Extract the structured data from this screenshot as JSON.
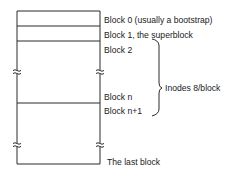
{
  "diagram": {
    "labels": {
      "block0": "Block 0 (usually a bootstrap)",
      "block1": "Block 1, the superblock",
      "block2": "Block 2",
      "inodes": "Inodes 8/block",
      "blockn": "Block n",
      "blockn1": "Block n+1",
      "last": "The last block"
    },
    "colors": {
      "line": "#2a2a2a",
      "background": "#ffffff"
    }
  }
}
